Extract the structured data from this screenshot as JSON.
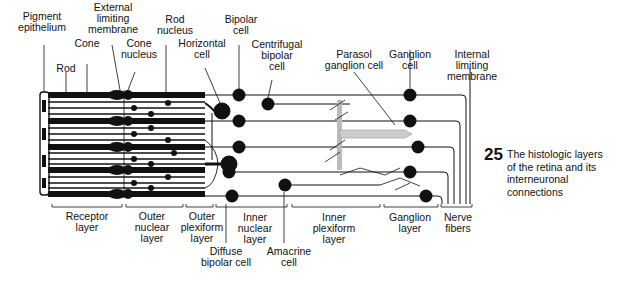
{
  "figure": {
    "number": "25",
    "caption": "The histologic layers\nof the retina and its\ninterneuronal\nconnections"
  },
  "top_labels": {
    "pigment_epithelium": "Pigment\nepithelium",
    "external_limiting_membrane": "External\nlimiting\nmembrane",
    "rod_nucleus": "Rod\nnucleus",
    "bipolar_cell": "Bipolar\ncell",
    "cone": "Cone",
    "cone_nucleus": "Cone\nnucleus",
    "horizontal_cell": "Horizontal\ncell",
    "centrifugal_bipolar_cell": "Centrifugal\nbipolar\ncell",
    "rod": "Rod",
    "parasol_ganglion_cell": "Parasol\nganglion cell",
    "ganglion_cell": "Ganglion\ncell",
    "internal_limiting_membrane": "Internal\nlimiting\nmembrane"
  },
  "layer_labels": {
    "receptor_layer": "Receptor\nlayer",
    "outer_nuclear_layer": "Outer\nnuclear\nlayer",
    "outer_plexiform_layer": "Outer\nplexiform\nlayer",
    "inner_nuclear_layer": "Inner\nnuclear\nlayer",
    "inner_plexiform_layer": "Inner\nplexiform\nlayer",
    "ganglion_layer": "Ganglion\nlayer",
    "nerve_fibers": "Nerve\nfibers"
  },
  "bottom_labels": {
    "diffuse_bipolar_cell": "Diffuse\nbipolar cell",
    "amacrine_cell": "Amacrine\ncell"
  }
}
